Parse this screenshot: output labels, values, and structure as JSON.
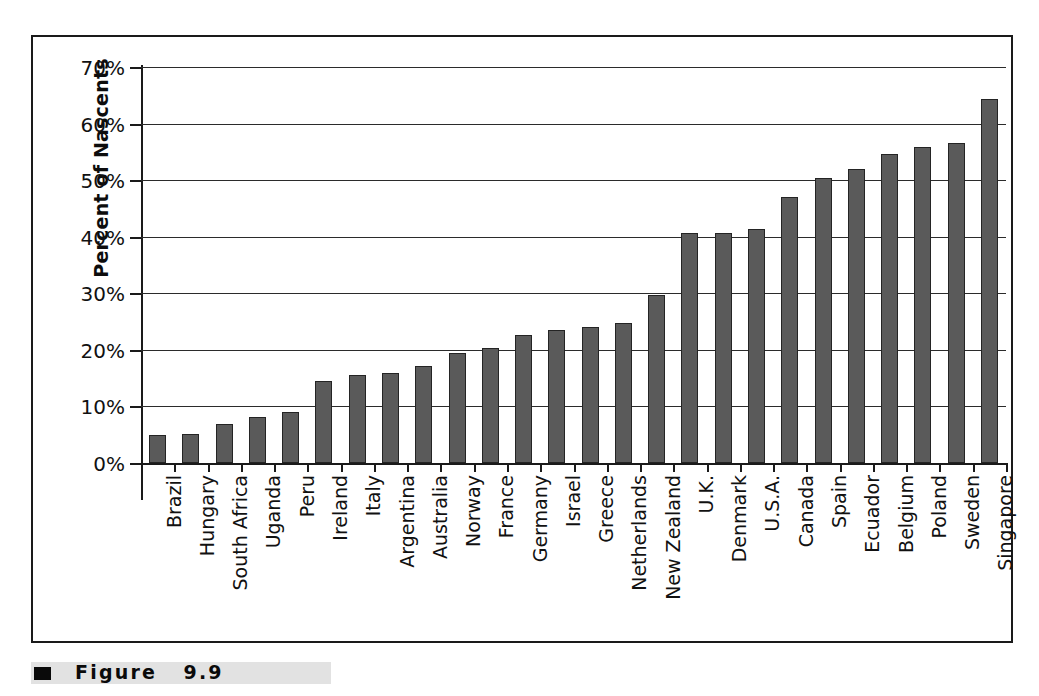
{
  "figure": {
    "caption_label": "Figure",
    "caption_number": "9.9",
    "bullet_icon": "black-square-bullet"
  },
  "chart_data": {
    "type": "bar",
    "title": "",
    "xlabel": "",
    "ylabel": "Percent of Nascents",
    "ylim": [
      0,
      70
    ],
    "ytick_labels": [
      "0%",
      "10%",
      "20%",
      "30%",
      "40%",
      "50%",
      "60%",
      "70%"
    ],
    "ytick_values": [
      0,
      10,
      20,
      30,
      40,
      50,
      60,
      70
    ],
    "grid": "horizontal",
    "legend": "none",
    "bar_color": "#5a5a5a",
    "bar_edge_color": "#242424",
    "categories": [
      "Brazil",
      "Hungary",
      "South Africa",
      "Uganda",
      "Peru",
      "Ireland",
      "Italy",
      "Argentina",
      "Australia",
      "Norway",
      "France",
      "Germany",
      "Israel",
      "Greece",
      "Netherlands",
      "New Zealand",
      "U.K.",
      "Denmark",
      "U.S.A.",
      "Canada",
      "Spain",
      "Ecuador",
      "Belgium",
      "Poland",
      "Sweden",
      "Singapore"
    ],
    "values": [
      4.9,
      5.2,
      6.9,
      8.1,
      9.1,
      14.5,
      15.6,
      15.9,
      17.1,
      19.4,
      20.4,
      22.6,
      23.5,
      24.1,
      24.8,
      29.7,
      40.6,
      40.7,
      41.3,
      47.1,
      50.3,
      52.0,
      54.6,
      55.8,
      56.6,
      64.3
    ]
  }
}
